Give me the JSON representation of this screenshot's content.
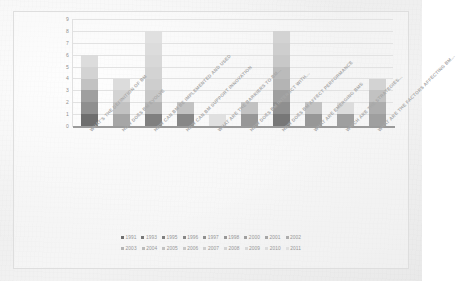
{
  "chart_data": {
    "type": "bar",
    "subtype": "stacked-bar",
    "title": "",
    "xlabel": "",
    "ylabel": "",
    "ylim": [
      0,
      9
    ],
    "yticks": [
      0,
      1,
      2,
      3,
      4,
      5,
      6,
      7,
      8,
      9
    ],
    "grid": true,
    "legend_position": "bottom",
    "categories": [
      "WHAT'S THE DEFINITION OF BM",
      "HOW DOES BM EVOLVE",
      "HOW CAN BM BE IMPLEMENTED AND USED",
      "HOW CAN BM SUPPORT INNOVATION",
      "WHAT ARE THE BARRIERS TO BM...",
      "HOW DOES BM INTERACT WITH...",
      "HOW DOES BM AFFECT PERFORMANCE",
      "WHAT ARE EMERGING BMS",
      "WHICH ARE THE STRATEGIES...",
      "WHAT ARE THE FACTORS AFFECTING BM..."
    ],
    "totals": [
      6,
      4,
      8,
      2,
      1,
      2,
      8,
      2,
      2,
      4
    ],
    "series": [
      {
        "name": "1991",
        "color": "#6e6e6e",
        "values": [
          1,
          0,
          0,
          0,
          0,
          0,
          0,
          0,
          0,
          0
        ]
      },
      {
        "name": "1993",
        "color": "#777777",
        "values": [
          0,
          0,
          0,
          0,
          0,
          0,
          1,
          0,
          0,
          0
        ]
      },
      {
        "name": "1995",
        "color": "#7f7f7f",
        "values": [
          0,
          0,
          1,
          0,
          0,
          0,
          0,
          0,
          0,
          0
        ]
      },
      {
        "name": "1996",
        "color": "#878787",
        "values": [
          0,
          0,
          0,
          1,
          0,
          0,
          0,
          0,
          0,
          0
        ]
      },
      {
        "name": "1997",
        "color": "#8f8f8f",
        "values": [
          1,
          0,
          0,
          0,
          0,
          0,
          1,
          0,
          0,
          0
        ]
      },
      {
        "name": "1998",
        "color": "#979797",
        "values": [
          0,
          0,
          0,
          0,
          0,
          1,
          0,
          1,
          0,
          0
        ]
      },
      {
        "name": "2000",
        "color": "#9f9f9f",
        "values": [
          1,
          0,
          0,
          0,
          0,
          0,
          1,
          0,
          1,
          1
        ]
      },
      {
        "name": "2001",
        "color": "#a6a6a6",
        "values": [
          0,
          1,
          0,
          0,
          0,
          0,
          0,
          0,
          0,
          0
        ]
      },
      {
        "name": "2002",
        "color": "#adadad",
        "values": [
          0,
          0,
          0,
          0,
          0,
          0,
          0,
          0,
          0,
          1
        ]
      },
      {
        "name": "2003",
        "color": "#b4b4b4",
        "values": [
          0,
          0,
          1,
          0,
          0,
          0,
          1,
          0,
          0,
          0
        ]
      },
      {
        "name": "2004",
        "color": "#bbbbbb",
        "values": [
          0,
          0,
          0,
          0,
          0,
          0,
          1,
          0,
          0,
          0
        ]
      },
      {
        "name": "2005",
        "color": "#c2c2c2",
        "values": [
          1,
          1,
          0,
          1,
          0,
          1,
          0,
          1,
          0,
          1
        ]
      },
      {
        "name": "2006",
        "color": "#c8c8c8",
        "values": [
          0,
          0,
          1,
          0,
          0,
          0,
          1,
          0,
          0,
          0
        ]
      },
      {
        "name": "2007",
        "color": "#cecece",
        "values": [
          0,
          0,
          1,
          0,
          0,
          0,
          1,
          0,
          0,
          0
        ]
      },
      {
        "name": "2008",
        "color": "#d3d3d3",
        "values": [
          1,
          1,
          1,
          0,
          0,
          0,
          1,
          0,
          0,
          1
        ]
      },
      {
        "name": "2009",
        "color": "#d8d8d8",
        "values": [
          0,
          0,
          1,
          0,
          0,
          0,
          0,
          0,
          0,
          0
        ]
      },
      {
        "name": "2010",
        "color": "#dcdcdc",
        "values": [
          1,
          1,
          1,
          0,
          0,
          0,
          0,
          0,
          1,
          0
        ]
      },
      {
        "name": "2011",
        "color": "#e0e0e0",
        "values": [
          0,
          0,
          1,
          0,
          1,
          0,
          0,
          0,
          0,
          0
        ]
      }
    ]
  },
  "legend": {
    "row1": [
      "1991",
      "1993",
      "1995",
      "1996",
      "1997",
      "1998",
      "2000",
      "2001",
      "2002"
    ],
    "row2": [
      "2003",
      "2004",
      "2005",
      "2006",
      "2007",
      "2008",
      "2009",
      "2010",
      "2011"
    ]
  },
  "colors": {
    "background": "#f1f1f1",
    "gridline": "#e2e2e2",
    "axis": "#9a9a9a",
    "tick_text": "#8f8f8f",
    "category_text": "#a8a8a8",
    "legend_text": "#969696"
  }
}
